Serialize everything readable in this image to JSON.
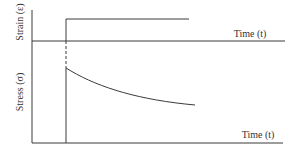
{
  "diagram": {
    "type": "stress-relaxation",
    "upper_plot": {
      "ylabel": "Strain (ε)",
      "xlabel": "Time (t)",
      "description": "Step strain applied at t0 and held constant"
    },
    "lower_plot": {
      "ylabel": "Stress (σ)",
      "xlabel": "Time (t)",
      "description": "Stress jumps at t0 then decays over time"
    }
  },
  "colors": {
    "line": "#3a3a3a",
    "text": "#333333",
    "background": "#ffffff"
  }
}
